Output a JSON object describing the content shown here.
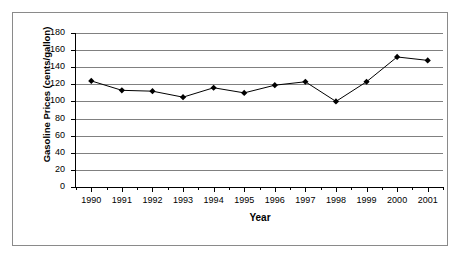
{
  "chart_data": {
    "type": "line",
    "title": "",
    "xlabel": "Year",
    "ylabel": "Gasoline Prices (cents/gallon)",
    "categories": [
      "1990",
      "1991",
      "1992",
      "1993",
      "1994",
      "1995",
      "1996",
      "1997",
      "1998",
      "1999",
      "2000",
      "2001"
    ],
    "values": [
      124,
      113,
      112,
      105,
      116,
      110,
      119,
      123,
      100,
      123,
      152,
      148
    ],
    "series": [
      {
        "name": "Gasoline Prices",
        "values": [
          124,
          113,
          112,
          105,
          116,
          110,
          119,
          123,
          100,
          123,
          152,
          148
        ]
      }
    ],
    "ylim": [
      0,
      180
    ],
    "y_ticks": [
      0,
      20,
      40,
      60,
      80,
      100,
      120,
      140,
      160,
      180
    ],
    "y_tick_labels": [
      "0",
      "20",
      "40",
      "60",
      "80",
      "100",
      "120",
      "140",
      "160",
      "180"
    ],
    "x_tick_labels": [
      "1990",
      "1991",
      "1992",
      "1993",
      "1994",
      "1995",
      "1996",
      "1997",
      "1998",
      "1999",
      "2000",
      "2001"
    ],
    "grid": true,
    "grid_axis": "y",
    "legend": false,
    "legend_position": "none",
    "marker": "diamond",
    "line_color": "#000000",
    "marker_color": "#000000",
    "grid_color": "#808080",
    "axis_color": "#000000",
    "background_color": "#ffffff",
    "border_color": "#8a8a8a"
  }
}
